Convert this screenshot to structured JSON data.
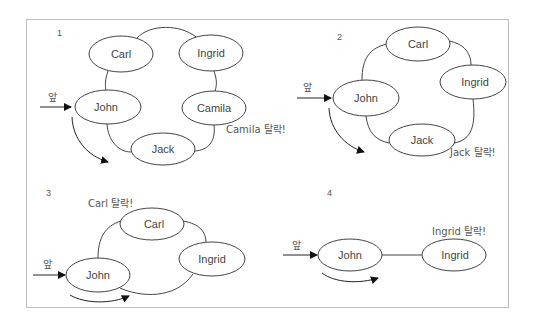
{
  "diagram": {
    "front_label": "앞",
    "panels": [
      {
        "number": "1",
        "nodes": [
          "Carl",
          "Ingrid",
          "John",
          "Camila",
          "Jack"
        ],
        "eliminated_label": "Camila 탈락!"
      },
      {
        "number": "2",
        "nodes": [
          "Carl",
          "Ingrid",
          "John",
          "Jack"
        ],
        "eliminated_label": "Jack 탈락!"
      },
      {
        "number": "3",
        "nodes": [
          "Carl",
          "Ingrid",
          "John"
        ],
        "eliminated_label": "Carl 탈락!"
      },
      {
        "number": "4",
        "nodes": [
          "John",
          "Ingrid"
        ],
        "eliminated_label": "Ingrid 탈락!"
      }
    ]
  },
  "colors": {
    "stroke": "#444444",
    "frame": "#bdbdbd",
    "background": "#ffffff"
  }
}
